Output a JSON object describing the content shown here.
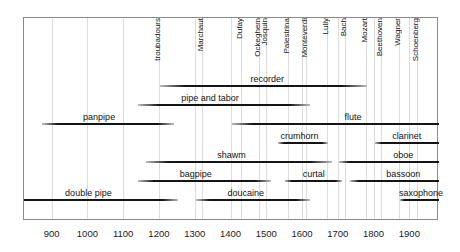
{
  "chart_data": {
    "type": "bar",
    "title": "",
    "subtitle": "",
    "xlabel": "",
    "ylabel": "",
    "xlim": [
      820,
      1980
    ],
    "grid": true,
    "legend_position": "none",
    "x_ticks": [
      {
        "label": "900",
        "value": 900
      },
      {
        "label": "1000",
        "value": 1000
      },
      {
        "label": "1100",
        "value": 1100
      },
      {
        "label": "1200",
        "value": 1200
      },
      {
        "label": "1300",
        "value": 1300
      },
      {
        "label": "1400",
        "value": 1400
      },
      {
        "label": "1500",
        "value": 1500
      },
      {
        "label": "1600",
        "value": 1600
      },
      {
        "label": "1700",
        "value": 1700
      },
      {
        "label": "1800",
        "value": 1800
      },
      {
        "label": "1900",
        "value": 1900
      }
    ],
    "composer_markers": [
      {
        "label": "troubadours",
        "value": 1200
      },
      {
        "label": "Marchaut",
        "value": 1320
      },
      {
        "label": "Dufay",
        "value": 1430
      },
      {
        "label": "Ockeghem",
        "value": 1480
      },
      {
        "label": "Josquin",
        "value": 1500
      },
      {
        "label": "Palestrina",
        "value": 1560
      },
      {
        "label": "Monteverdi",
        "value": 1610
      },
      {
        "label": "Lully",
        "value": 1670
      },
      {
        "label": "Bach",
        "value": 1720
      },
      {
        "label": "Mozart",
        "value": 1780
      },
      {
        "label": "Beethoven",
        "value": 1820
      },
      {
        "label": "Wagner",
        "value": 1870
      },
      {
        "label": "Schoenberg",
        "value": 1920
      }
    ],
    "rows": [
      {
        "row": 0,
        "bars": [
          {
            "name": "recorder",
            "start": 1200,
            "end": 1780,
            "label": "recorder",
            "label_at": 1500,
            "fade": "both"
          }
        ]
      },
      {
        "row": 1,
        "bars": [
          {
            "name": "pipe and tabor",
            "start": 1140,
            "end": 1620,
            "label": "pipe and tabor",
            "label_at": 1340,
            "fade": "both"
          }
        ]
      },
      {
        "row": 2,
        "bars": [
          {
            "name": "panpipe",
            "start": 870,
            "end": 1240,
            "label": "panpipe",
            "label_at": 1030,
            "fade": "both"
          },
          {
            "name": "flute",
            "start": 1400,
            "end": 1980,
            "label": "flute",
            "label_at": 1740,
            "fade": "left"
          }
        ]
      },
      {
        "row": 3,
        "bars": [
          {
            "name": "crumhorn",
            "start": 1530,
            "end": 1670,
            "label": "crumhorn",
            "label_at": 1590,
            "fade": "both"
          },
          {
            "name": "clarinet",
            "start": 1800,
            "end": 1980,
            "label": "clarinet",
            "label_at": 1890,
            "fade": "left"
          }
        ]
      },
      {
        "row": 4,
        "bars": [
          {
            "name": "shawm",
            "start": 1160,
            "end": 1680,
            "label": "shawm",
            "label_at": 1400,
            "fade": "both"
          },
          {
            "name": "oboe",
            "start": 1700,
            "end": 1980,
            "label": "oboe",
            "label_at": 1880,
            "fade": "left"
          }
        ]
      },
      {
        "row": 5,
        "bars": [
          {
            "name": "bagpipe",
            "start": 1140,
            "end": 1510,
            "label": "bagpipe",
            "label_at": 1300,
            "fade": "both"
          },
          {
            "name": "curtal",
            "start": 1550,
            "end": 1710,
            "label": "curtal",
            "label_at": 1630,
            "fade": "both"
          },
          {
            "name": "bassoon",
            "start": 1730,
            "end": 1980,
            "label": "bassoon",
            "label_at": 1880,
            "fade": "left"
          }
        ]
      },
      {
        "row": 6,
        "bars": [
          {
            "name": "double pipe",
            "start": 820,
            "end": 1250,
            "label": "double pipe",
            "label_at": 1000,
            "fade": "right"
          },
          {
            "name": "doucaine",
            "start": 1300,
            "end": 1620,
            "label": "doucaine",
            "label_at": 1440,
            "fade": "both"
          },
          {
            "name": "saxophone",
            "start": 1870,
            "end": 1980,
            "label": "saxophone",
            "label_at": 1930,
            "fade": "left"
          }
        ]
      }
    ]
  },
  "colors": {
    "bar": "#141414",
    "frame": "#8a8a8a",
    "grid": "#dcdcdc",
    "text": "#111111",
    "background": "#ffffff"
  }
}
